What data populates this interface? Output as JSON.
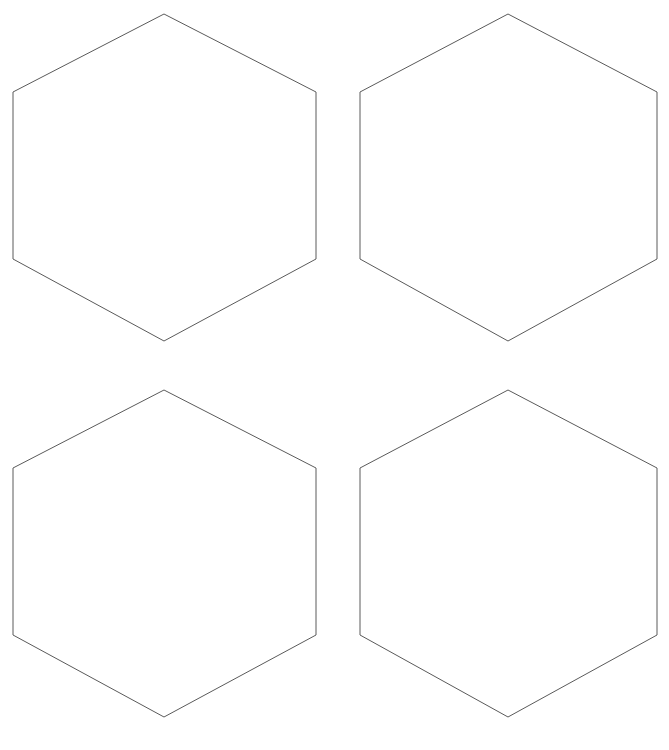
{
  "canvas": {
    "width": 669,
    "height": 750,
    "background_color": "#ffffff",
    "title": "Hexagon Grid"
  },
  "style": {
    "stroke_color": "#5a5a5a",
    "stroke_width": 1,
    "fill_color": "#ffffff"
  },
  "shapes": {
    "type": "hexagon",
    "count": 4,
    "orientation": "pointy-top",
    "rows": 2,
    "columns": 2,
    "hexagon_width": 303,
    "hexagon_height": 327,
    "column_spacing": 344,
    "row_spacing": 376,
    "items": [
      {
        "id": "hexagon-top-left",
        "label": "Hexagon 1",
        "row": 1,
        "column": 1,
        "center_x": 164.5,
        "center_y": 177.5,
        "points": "164,14 316,92 316,259 164,341 13,259 13,92"
      },
      {
        "id": "hexagon-top-right",
        "label": "Hexagon 2",
        "row": 1,
        "column": 2,
        "center_x": 508.5,
        "center_y": 177.5,
        "points": "508,14 657,92 657,259 508,341 360,259 360,92"
      },
      {
        "id": "hexagon-bottom-left",
        "label": "Hexagon 3",
        "row": 2,
        "column": 1,
        "center_x": 164.5,
        "center_y": 553.5,
        "points": "164,390 316,468 316,635 164,717 13,635 13,468"
      },
      {
        "id": "hexagon-bottom-right",
        "label": "Hexagon 4",
        "row": 2,
        "column": 2,
        "center_x": 508.5,
        "center_y": 553.5,
        "points": "508,390 657,468 657,635 508,717 360,635 360,468"
      }
    ]
  }
}
